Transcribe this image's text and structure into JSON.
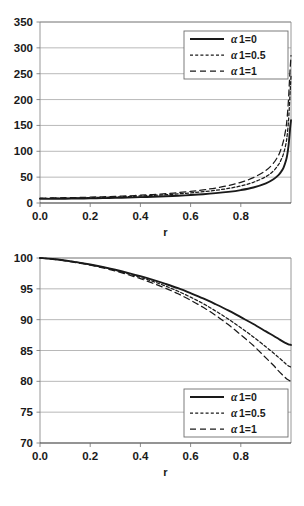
{
  "figure": {
    "name": "two-panel-line-chart",
    "background": "#ffffff",
    "line_color": "#1a1a1a",
    "grid_color": "#9a9a9a"
  },
  "chart_data": [
    {
      "id": "top",
      "type": "line",
      "title": "",
      "xlabel": "r",
      "ylabel": "",
      "xlim": [
        0,
        1
      ],
      "ylim": [
        0,
        350
      ],
      "xticks": [
        "0.0",
        "0.2",
        "0.4",
        "0.6",
        "0.8"
      ],
      "xtick_values": [
        0.0,
        0.2,
        0.4,
        0.6,
        0.8
      ],
      "yticks": [
        "0",
        "50",
        "100",
        "150",
        "200",
        "250",
        "300",
        "350"
      ],
      "ytick_values": [
        0,
        50,
        100,
        150,
        200,
        250,
        300,
        350
      ],
      "grid": "horizontal",
      "legend_position": "top-right",
      "x": [
        0.0,
        0.05,
        0.1,
        0.15,
        0.2,
        0.25,
        0.3,
        0.35,
        0.4,
        0.45,
        0.5,
        0.55,
        0.6,
        0.65,
        0.7,
        0.75,
        0.8,
        0.85,
        0.9,
        0.93,
        0.95,
        0.96,
        0.97,
        0.98,
        0.985,
        0.99,
        0.993,
        0.996,
        0.998,
        1.0
      ],
      "series": [
        {
          "name": "α 1=0",
          "alpha": 0,
          "style": "solid",
          "values": [
            8,
            8.1,
            8.3,
            8.6,
            9,
            9.5,
            10,
            10.6,
            11.3,
            12.1,
            13,
            14.1,
            15.4,
            17,
            19,
            21.5,
            25,
            30,
            38,
            46,
            54,
            60,
            68,
            82,
            93,
            110,
            125,
            142,
            152,
            160
          ]
        },
        {
          "name": "α 1=0.5",
          "alpha": 0.5,
          "style": "dashed-fine",
          "values": [
            9,
            9.2,
            9.5,
            9.9,
            10.4,
            11,
            11.7,
            12.5,
            13.5,
            14.6,
            16,
            17.6,
            19.5,
            21.8,
            24.6,
            28.2,
            33,
            40,
            51,
            62,
            74,
            83,
            95,
            115,
            132,
            158,
            182,
            210,
            228,
            245
          ]
        },
        {
          "name": "α 1=1",
          "alpha": 1,
          "style": "dashed-coarse",
          "values": [
            9.5,
            9.8,
            10.2,
            10.7,
            11.3,
            12,
            12.8,
            13.8,
            15,
            16.4,
            18,
            20,
            22.4,
            25.3,
            29,
            33.6,
            40,
            49,
            63,
            77,
            92,
            104,
            120,
            145,
            167,
            200,
            228,
            255,
            270,
            285
          ]
        }
      ]
    },
    {
      "id": "bottom",
      "type": "line",
      "title": "",
      "xlabel": "r",
      "ylabel": "",
      "xlim": [
        0,
        1
      ],
      "ylim": [
        70,
        100
      ],
      "xticks": [
        "0.0",
        "0.2",
        "0.4",
        "0.6",
        "0.8"
      ],
      "xtick_values": [
        0.0,
        0.2,
        0.4,
        0.6,
        0.8
      ],
      "yticks": [
        "70",
        "75",
        "80",
        "85",
        "90",
        "95",
        "100"
      ],
      "ytick_values": [
        70,
        75,
        80,
        85,
        90,
        95,
        100
      ],
      "grid": "horizontal",
      "legend_position": "bottom-right",
      "x": [
        0.0,
        0.05,
        0.1,
        0.15,
        0.2,
        0.25,
        0.3,
        0.35,
        0.4,
        0.45,
        0.5,
        0.55,
        0.6,
        0.65,
        0.7,
        0.75,
        0.8,
        0.85,
        0.9,
        0.93,
        0.95,
        0.97,
        0.98,
        0.99,
        0.995,
        1.0
      ],
      "series": [
        {
          "name": "α 1=0",
          "alpha": 0,
          "style": "solid",
          "values": [
            100.0,
            99.85,
            99.6,
            99.3,
            98.95,
            98.55,
            98.1,
            97.6,
            97.05,
            96.45,
            95.8,
            95.1,
            94.3,
            93.45,
            92.5,
            91.5,
            90.4,
            89.3,
            88.1,
            87.4,
            86.9,
            86.4,
            86.2,
            86.0,
            85.95,
            85.9
          ]
        },
        {
          "name": "α 1=0.5",
          "alpha": 0.5,
          "style": "dashed-fine",
          "values": [
            100.0,
            99.85,
            99.6,
            99.3,
            98.9,
            98.5,
            98.0,
            97.45,
            96.85,
            96.2,
            95.45,
            94.6,
            93.65,
            92.6,
            91.4,
            90.1,
            88.7,
            87.2,
            85.6,
            84.6,
            83.9,
            83.2,
            82.8,
            82.5,
            82.4,
            82.3
          ]
        },
        {
          "name": "α 1=1",
          "alpha": 1,
          "style": "dashed-coarse",
          "values": [
            100.0,
            99.8,
            99.55,
            99.2,
            98.85,
            98.4,
            97.9,
            97.3,
            96.65,
            95.9,
            95.1,
            94.2,
            93.15,
            92.0,
            90.7,
            89.2,
            87.55,
            85.8,
            83.8,
            82.6,
            81.7,
            80.9,
            80.5,
            80.2,
            80.1,
            80.0
          ]
        }
      ]
    }
  ]
}
